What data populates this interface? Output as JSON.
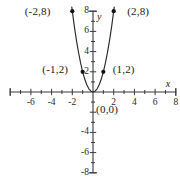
{
  "chart_data": {
    "type": "line",
    "title": "",
    "xlabel": "x",
    "ylabel": "y",
    "equation": "y = 2x^2",
    "xlim": [
      -8,
      8
    ],
    "ylim": [
      -8,
      8
    ],
    "grid": false,
    "legend": false,
    "x_ticks": [
      -8,
      -6,
      -4,
      -2,
      0,
      2,
      4,
      6,
      8
    ],
    "x_tick_labels": [
      "",
      "-6",
      "-4",
      "-2",
      "",
      "2",
      "4",
      "6",
      "8"
    ],
    "y_ticks": [
      -8,
      -6,
      -4,
      -2,
      0,
      2,
      4,
      6,
      8
    ],
    "y_tick_labels": [
      "-8",
      "-6",
      "-4",
      "",
      "",
      "2",
      "4",
      "6",
      "8"
    ],
    "series": [
      {
        "name": "y = 2x^2",
        "x": [
          -2.05,
          -1.8,
          -1.6,
          -1.4,
          -1.2,
          -1.0,
          -0.8,
          -0.6,
          -0.4,
          -0.2,
          0,
          0.2,
          0.4,
          0.6,
          0.8,
          1.0,
          1.2,
          1.4,
          1.6,
          1.8,
          2.05
        ],
        "y": [
          8.4,
          6.48,
          5.12,
          3.92,
          2.88,
          2.0,
          1.28,
          0.72,
          0.32,
          0.08,
          0,
          0.08,
          0.32,
          0.72,
          1.28,
          2.0,
          2.88,
          3.92,
          5.12,
          6.48,
          8.4
        ]
      }
    ],
    "points": [
      {
        "x": -2,
        "y": 8,
        "label": "(-2,8)",
        "label_x": -6.6,
        "label_y": 8.0
      },
      {
        "x": 2,
        "y": 8,
        "label": "(2,8)",
        "label_x": 3.3,
        "label_y": 8.0
      },
      {
        "x": -1,
        "y": 2,
        "label": "(-1,2)",
        "label_x": -4.9,
        "label_y": 2.25
      },
      {
        "x": 1,
        "y": 2,
        "label": "(1,2)",
        "label_x": 1.9,
        "label_y": 2.25
      },
      {
        "x": 0,
        "y": 0,
        "label": "(0,0)",
        "label_x": 0.3,
        "label_y": -1.7
      }
    ],
    "colors": {
      "curve": "#2b2b2b",
      "axis": "#3a3a3a",
      "point": "#111111",
      "text": "#1a1a1a",
      "background": "#ffffff"
    }
  }
}
